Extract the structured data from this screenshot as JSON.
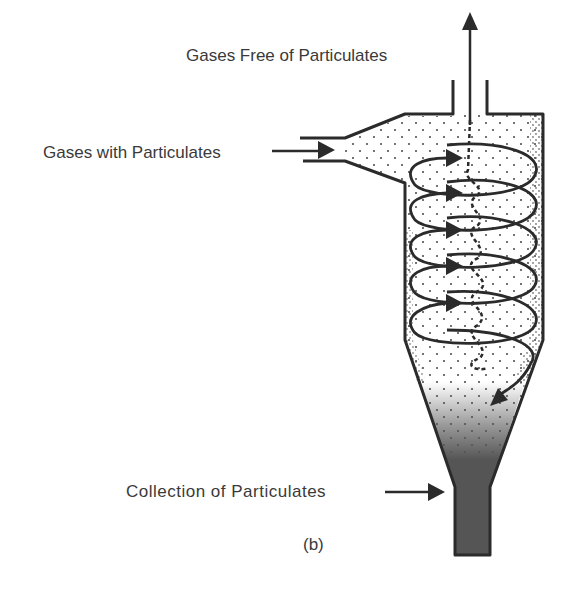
{
  "diagram": {
    "panel_label": "(b)",
    "labels": {
      "outlet": "Gases Free of Particulates",
      "inlet": "Gases with Particulates",
      "collection": "Collection of Particulates"
    },
    "colors": {
      "stroke": "#2b2b2b",
      "collected_dust": "#555555",
      "text": "#3a3a3a"
    },
    "spiral_turns": 5
  }
}
